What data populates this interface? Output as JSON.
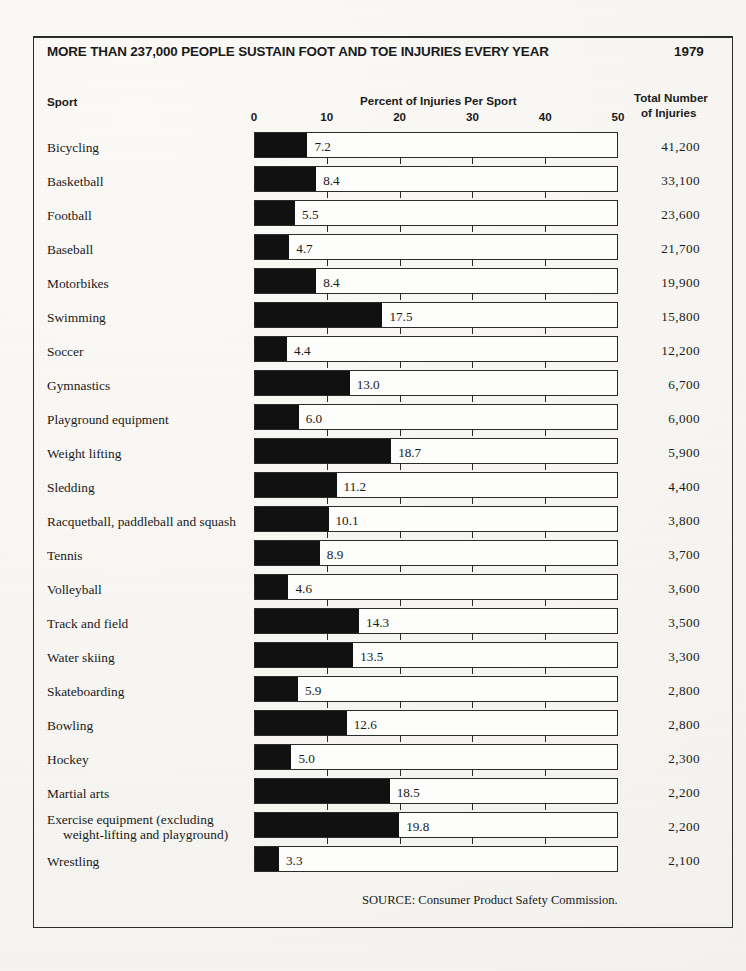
{
  "headline": {
    "title": "MORE THAN 237,000 PEOPLE SUSTAIN FOOT AND TOE INJURIES EVERY YEAR",
    "year": "1979"
  },
  "columns": {
    "sport": "Sport",
    "percent": "Percent of Injuries Per Sport",
    "total_line1": "Total Number",
    "total_line2": "of Injuries"
  },
  "source": "SOURCE: Consumer Product Safety Commission.",
  "colors": {
    "bar_fill": "#111111",
    "bar_outline": "#2b2b2b",
    "paper": "#f7f6f2",
    "text": "#1a1a1a"
  },
  "chart_data": {
    "type": "bar",
    "title": "MORE THAN 237,000 PEOPLE SUSTAIN FOOT AND TOE INJURIES EVERY YEAR",
    "subtitle": "1979",
    "orientation": "horizontal",
    "xlabel": "Percent of Injuries Per Sport",
    "ylabel": "Sport",
    "xlim": [
      0,
      50
    ],
    "xticks": [
      0,
      10,
      20,
      30,
      40,
      50
    ],
    "xtick_labels": [
      "0",
      "10",
      "20",
      "30",
      "40",
      "50"
    ],
    "grid": false,
    "legend": "none",
    "value_label_format": "one-decimal",
    "categories": [
      "Bicycling",
      "Basketball",
      "Football",
      "Baseball",
      "Motorbikes",
      "Swimming",
      "Soccer",
      "Gymnastics",
      "Playground equipment",
      "Weight lifting",
      "Sledding",
      "Racquetball, paddleball and squash",
      "Tennis",
      "Volleyball",
      "Track and  field",
      "Water skiing",
      "Skateboarding",
      "Bowling",
      "Hockey",
      "Martial arts",
      "Exercise equipment (excluding weight-lifting and playground)",
      "Wrestling"
    ],
    "values": [
      7.2,
      8.4,
      5.5,
      4.7,
      8.4,
      17.5,
      4.4,
      13.0,
      6.0,
      18.7,
      11.2,
      10.1,
      8.9,
      4.6,
      14.3,
      13.5,
      5.9,
      12.6,
      5.0,
      18.5,
      19.8,
      3.3
    ],
    "secondary_series": {
      "name": "Total Number of Injuries",
      "values": [
        "41,200",
        "33,100",
        "23,600",
        "21,700",
        "19,900",
        "15,800",
        "12,200",
        "6,700",
        "6,000",
        "5,900",
        "4,400",
        "3,800",
        "3,700",
        "3,600",
        "3,500",
        "3,300",
        "2,800",
        "2,800",
        "2,300",
        "2,200",
        "2,200",
        "2,100"
      ]
    },
    "annotations": [
      "SOURCE: Consumer Product Safety Commission."
    ]
  },
  "rows": [
    {
      "sport": "Bicycling",
      "sport_l2": "",
      "percent": 7.2,
      "percent_label": "7.2",
      "total": "41,200"
    },
    {
      "sport": "Basketball",
      "sport_l2": "",
      "percent": 8.4,
      "percent_label": "8.4",
      "total": "33,100"
    },
    {
      "sport": "Football",
      "sport_l2": "",
      "percent": 5.5,
      "percent_label": "5.5",
      "total": "23,600"
    },
    {
      "sport": "Baseball",
      "sport_l2": "",
      "percent": 4.7,
      "percent_label": "4.7",
      "total": "21,700"
    },
    {
      "sport": "Motorbikes",
      "sport_l2": "",
      "percent": 8.4,
      "percent_label": "8.4",
      "total": "19,900"
    },
    {
      "sport": "Swimming",
      "sport_l2": "",
      "percent": 17.5,
      "percent_label": "17.5",
      "total": "15,800"
    },
    {
      "sport": "Soccer",
      "sport_l2": "",
      "percent": 4.4,
      "percent_label": "4.4",
      "total": "12,200"
    },
    {
      "sport": "Gymnastics",
      "sport_l2": "",
      "percent": 13.0,
      "percent_label": "13.0",
      "total": "6,700"
    },
    {
      "sport": "Playground equipment",
      "sport_l2": "",
      "percent": 6.0,
      "percent_label": "6.0",
      "total": "6,000"
    },
    {
      "sport": "Weight lifting",
      "sport_l2": "",
      "percent": 18.7,
      "percent_label": "18.7",
      "total": "5,900"
    },
    {
      "sport": "Sledding",
      "sport_l2": "",
      "percent": 11.2,
      "percent_label": "11.2",
      "total": "4,400"
    },
    {
      "sport": "Racquetball, paddleball and squash",
      "sport_l2": "",
      "percent": 10.1,
      "percent_label": "10.1",
      "total": "3,800"
    },
    {
      "sport": "Tennis",
      "sport_l2": "",
      "percent": 8.9,
      "percent_label": "8.9",
      "total": "3,700"
    },
    {
      "sport": "Volleyball",
      "sport_l2": "",
      "percent": 4.6,
      "percent_label": "4.6",
      "total": "3,600"
    },
    {
      "sport": "Track and  field",
      "sport_l2": "",
      "percent": 14.3,
      "percent_label": "14.3",
      "total": "3,500"
    },
    {
      "sport": "Water skiing",
      "sport_l2": "",
      "percent": 13.5,
      "percent_label": "13.5",
      "total": "3,300"
    },
    {
      "sport": "Skateboarding",
      "sport_l2": "",
      "percent": 5.9,
      "percent_label": "5.9",
      "total": "2,800"
    },
    {
      "sport": "Bowling",
      "sport_l2": "",
      "percent": 12.6,
      "percent_label": "12.6",
      "total": "2,800"
    },
    {
      "sport": "Hockey",
      "sport_l2": "",
      "percent": 5.0,
      "percent_label": "5.0",
      "total": "2,300"
    },
    {
      "sport": "Martial arts",
      "sport_l2": "",
      "percent": 18.5,
      "percent_label": "18.5",
      "total": "2,200"
    },
    {
      "sport": "Exercise equipment (excluding",
      "sport_l2": "weight-lifting and playground)",
      "percent": 19.8,
      "percent_label": "19.8",
      "total": "2,200"
    },
    {
      "sport": "Wrestling",
      "sport_l2": "",
      "percent": 3.3,
      "percent_label": "3.3",
      "total": "2,100"
    }
  ]
}
